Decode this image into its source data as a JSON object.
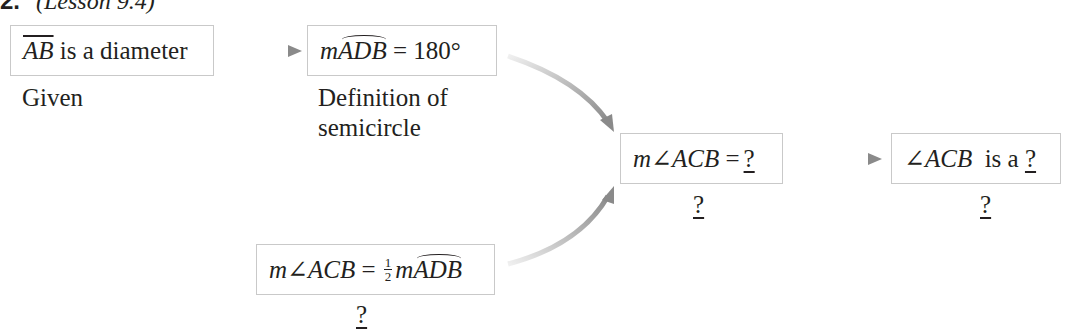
{
  "header": {
    "number": "2.",
    "lesson": "(Lesson 9.4)"
  },
  "nodes": [
    {
      "id": "given",
      "parts": {
        "seg": "AB",
        "rest": " is a diameter"
      },
      "reason": "Given"
    },
    {
      "id": "arc-measure",
      "parts": {
        "m": "m",
        "arc": "ADB",
        "rest": " = 180°"
      },
      "reason_line1": "Definition of",
      "reason_line2": "semicircle"
    },
    {
      "id": "inscribed-angle",
      "parts": {
        "lhs": "m∠ACB",
        "eq": " = ",
        "num": "1",
        "den": "2",
        "m": "m",
        "arc": "ADB"
      },
      "reason": "?"
    },
    {
      "id": "angle-measure",
      "parts": {
        "lhs": "m∠ACB",
        "eq": " =",
        "blank": "?"
      },
      "reason": "?"
    },
    {
      "id": "angle-type",
      "parts": {
        "lhs": "∠ACB",
        "rest": "  is a ",
        "blank": "?"
      },
      "reason": "?"
    }
  ],
  "colors": {
    "box_border": "#c9c9c9",
    "arrow": "#8a8a8a",
    "text": "#231f20"
  }
}
